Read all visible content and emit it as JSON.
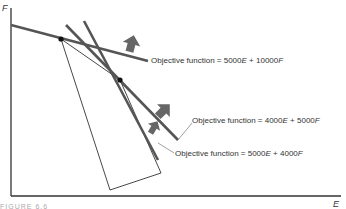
{
  "diagram": {
    "type": "linear-programming-graph",
    "axes": {
      "x_label": "E",
      "y_label": "F"
    },
    "feasible_region": {
      "description": "Quadrilateral feasible region bounded by constraint lines",
      "vertices_px": [
        [
          61,
          39
        ],
        [
          110,
          190
        ],
        [
          161,
          173
        ],
        [
          120,
          80
        ]
      ]
    },
    "objective_functions": [
      {
        "label": "Objective function = 5000E + 10000F",
        "prefix": "Objective function = 5000",
        "var1": "E",
        "mid": " + 10000",
        "var2": "F"
      },
      {
        "label": "Objective function = 4000E + 5000F",
        "prefix": "Objective function = 4000",
        "var1": "E",
        "mid": " + 5000",
        "var2": "F"
      },
      {
        "label": "Objective function = 5000E + 4000F",
        "prefix": "Objective function = 5000",
        "var1": "E",
        "mid": " + 4000",
        "var2": "F"
      }
    ],
    "optimal_points": [
      "upper-left vertex",
      "middle vertex"
    ],
    "figure_caption": "FIGURE 6.6"
  },
  "colors": {
    "line": "#555555",
    "thin_line": "#333333",
    "arrow": "#666666",
    "text": "#333333"
  }
}
